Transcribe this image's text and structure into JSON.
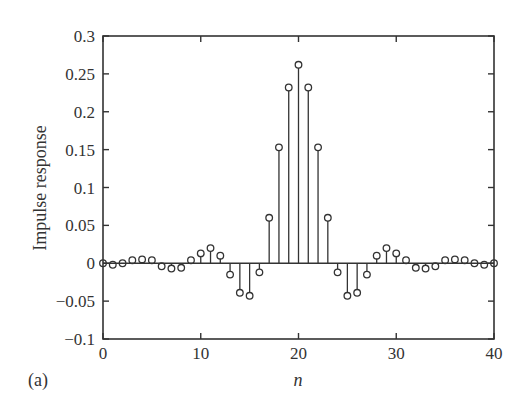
{
  "chart_data": {
    "type": "stem",
    "title": "",
    "panel_label": "(a)",
    "xlabel": "n",
    "ylabel": "Impulse response",
    "xlim": [
      0,
      40
    ],
    "ylim": [
      -0.1,
      0.3
    ],
    "xticks": [
      0,
      10,
      20,
      30,
      40
    ],
    "xtick_labels": [
      "0",
      "10",
      "20",
      "30",
      "40"
    ],
    "yticks": [
      -0.1,
      -0.05,
      0,
      0.05,
      0.1,
      0.15,
      0.2,
      0.25,
      0.3
    ],
    "ytick_labels": [
      "−0.1",
      "−0.05",
      "0",
      "0.05",
      "0.1",
      "0.15",
      "0.2",
      "0.25",
      "0.3"
    ],
    "grid": false,
    "legend": null,
    "x": [
      0,
      1,
      2,
      3,
      4,
      5,
      6,
      7,
      8,
      9,
      10,
      11,
      12,
      13,
      14,
      15,
      16,
      17,
      18,
      19,
      20,
      21,
      22,
      23,
      24,
      25,
      26,
      27,
      28,
      29,
      30,
      31,
      32,
      33,
      34,
      35,
      36,
      37,
      38,
      39,
      40
    ],
    "values": [
      0,
      -0.002,
      0,
      0.004,
      0.005,
      0.004,
      -0.004,
      -0.007,
      -0.006,
      0.004,
      0.013,
      0.02,
      0.01,
      -0.015,
      -0.039,
      -0.043,
      -0.012,
      0.06,
      0.153,
      0.232,
      0.262,
      0.232,
      0.153,
      0.06,
      -0.012,
      -0.043,
      -0.039,
      -0.015,
      0.01,
      0.02,
      0.013,
      0.004,
      -0.006,
      -0.007,
      -0.004,
      0.004,
      0.005,
      0.004,
      0,
      -0.002,
      0
    ],
    "colors": {
      "line": "#333333",
      "marker": "#333333",
      "background": "#ffffff"
    }
  }
}
